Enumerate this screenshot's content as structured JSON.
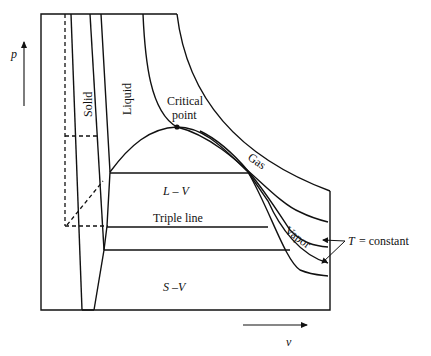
{
  "diagram": {
    "axes": {
      "y_label": "p",
      "x_label": "v"
    },
    "regions": {
      "solid": "Solid",
      "liquid": "Liquid",
      "gas": "Gas",
      "vapor": "Vapor",
      "liquid_vapor": "L – V",
      "solid_vapor": "S –V"
    },
    "annotations": {
      "critical_point_line1": "Critical",
      "critical_point_line2": "point",
      "triple_line": "Triple line",
      "isotherm_T": "T",
      "isotherm_rest": "= constant"
    },
    "colors": {
      "line": "#111111",
      "background": "#ffffff"
    }
  }
}
